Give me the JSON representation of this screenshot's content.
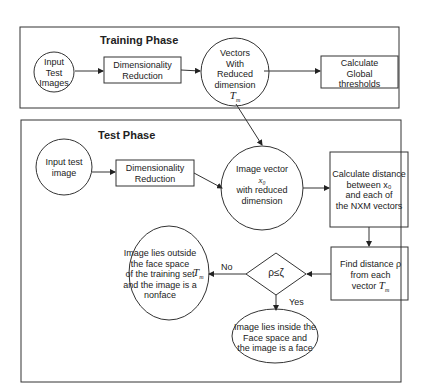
{
  "training": {
    "title": "Training Phase",
    "input": [
      "Input",
      "Test",
      "Images"
    ],
    "dimred": [
      "Dimensionality",
      "Reduction"
    ],
    "vectors": [
      "Vectors",
      "With",
      "Reduced",
      "dimension"
    ],
    "vectors_symbol": "T",
    "vectors_sub": "m",
    "global": [
      "Calculate",
      "Global",
      "thresholds"
    ]
  },
  "test": {
    "title": "Test Phase",
    "input": [
      "Input test",
      "image"
    ],
    "dimred": [
      "Dimensionality",
      "Reduction"
    ],
    "imgvec": [
      "Image vector",
      "x₀",
      "with reduced",
      "dimension"
    ],
    "calcdist": [
      "Calculate distance",
      "between  x₀",
      "and each of",
      "the NXM vectors"
    ],
    "finddist": [
      "Find distance  ρ",
      "from each",
      "vector"
    ],
    "finddist_symbol": "T",
    "finddist_sub": "m",
    "decision": "ρ≤ζ",
    "no_label": "No",
    "yes_label": "Yes",
    "outside": [
      "Image lies outside",
      "the face space",
      "of the training set",
      "and the image is a",
      "nonface"
    ],
    "outside_symbol": "T",
    "outside_sub": "m",
    "inside": [
      "Image lies inside the",
      "Face space and",
      "the image is a face"
    ]
  }
}
